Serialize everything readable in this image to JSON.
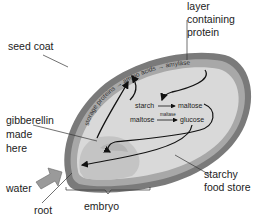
{
  "diagram": {
    "labels": {
      "layer": [
        "layer",
        "containing",
        "protein"
      ],
      "seed_coat": "seed coat",
      "gibberellin": [
        "gibberellin",
        "made",
        "here"
      ],
      "water": "water",
      "root": "root",
      "embryo": "embryo",
      "starchy": [
        "starchy",
        "food store"
      ]
    },
    "layer_text": {
      "storage_proteins": "storage proteins",
      "amino_acids": "amino acids",
      "amylase": "amylase"
    },
    "reactions": {
      "starch": "starch",
      "maltose1": "maltose",
      "maltose2": "maltose",
      "maltase": "maltase",
      "glucose": "glucose"
    },
    "colors": {
      "seed_coat": "#7a7a7a",
      "aleurone": "#a8a8a8",
      "endosperm": "#d9d9d9",
      "embryo": "#c4c4c4",
      "arrow": "#111111"
    }
  }
}
